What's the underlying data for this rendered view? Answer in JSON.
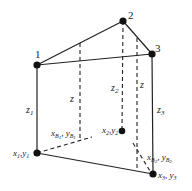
{
  "diagram": {
    "type": "triangular prism element with vertical edges",
    "colors": {
      "stroke": "#222222",
      "background": "#ffffff"
    },
    "top_nodes": [
      {
        "id": "1",
        "label": "1",
        "x": 37,
        "y": 65
      },
      {
        "id": "2",
        "label": "2",
        "x": 123,
        "y": 21
      },
      {
        "id": "3",
        "label": "3",
        "x": 152,
        "y": 54
      }
    ],
    "bottom_nodes": [
      {
        "id": "b1",
        "label": "x1, y1",
        "x": 37,
        "y": 153
      },
      {
        "id": "b2",
        "label": "x2,y2",
        "x": 122,
        "y": 131
      },
      {
        "id": "b3",
        "label": "x3, y3",
        "x": 153,
        "y": 174
      }
    ],
    "edge_labels": {
      "z1": "z1",
      "z2": "z2",
      "z3": "z3",
      "z_mid_left": "z",
      "z_mid_right": "z"
    },
    "intermediate_points": {
      "xB1": "xB1, yB1",
      "xB2": "xB2, yB2"
    }
  }
}
